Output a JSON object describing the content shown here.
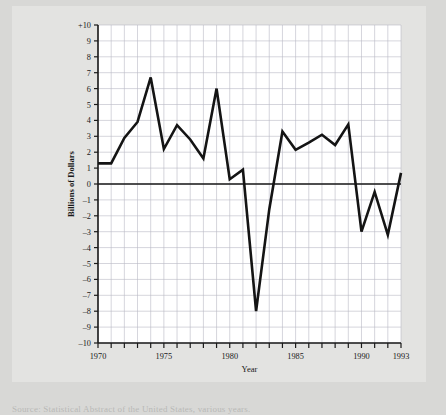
{
  "figure": {
    "background_color": "#e3e3e1",
    "page_color": "#d8d8d6",
    "plot_background": "#ffffff",
    "line_color": "#141414",
    "grid_color": "#b9b9c4",
    "axis_color": "#1a1a1a",
    "caption": "Source: Statistical Abstract of the United States, various years."
  },
  "chart_data": {
    "type": "line",
    "title": "",
    "xlabel": "Year",
    "ylabel": "Billions of Dollars",
    "xlim": [
      1970,
      1993
    ],
    "ylim": [
      -10,
      10
    ],
    "grid": true,
    "legend": "none",
    "x_tick_labels": [
      "1970",
      "1975",
      "1980",
      "1985",
      "1990",
      "1993"
    ],
    "x_tick_values": [
      1970,
      1975,
      1980,
      1985,
      1990,
      1993
    ],
    "y_tick_labels": [
      "+10",
      "9",
      "8",
      "7",
      "6",
      "5",
      "4",
      "3",
      "2",
      "1",
      "0",
      "–1",
      "–2",
      "–3",
      "–4",
      "–5",
      "–6",
      "–7",
      "–8",
      "–9",
      "–10"
    ],
    "y_tick_values": [
      10,
      9,
      8,
      7,
      6,
      5,
      4,
      3,
      2,
      1,
      0,
      -1,
      -2,
      -3,
      -4,
      -5,
      -6,
      -7,
      -8,
      -9,
      -10
    ],
    "x": [
      1970,
      1971,
      1972,
      1973,
      1974,
      1975,
      1976,
      1977,
      1978,
      1979,
      1980,
      1981,
      1982,
      1983,
      1984,
      1985,
      1986,
      1987,
      1988,
      1989,
      1990,
      1991,
      1992,
      1993
    ],
    "values": [
      1.3,
      1.3,
      2.9,
      3.9,
      6.7,
      2.2,
      3.7,
      2.8,
      1.6,
      6.0,
      0.3,
      0.9,
      -8.0,
      -1.6,
      3.3,
      2.15,
      2.6,
      3.1,
      2.45,
      3.75,
      -3.0,
      -0.5,
      -3.2,
      0.7
    ]
  }
}
